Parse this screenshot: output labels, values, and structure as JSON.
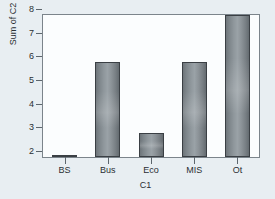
{
  "chart_data": {
    "type": "bar",
    "title": "",
    "categories": [
      "BS",
      "Bus",
      "Eco",
      "MIS",
      "Ot"
    ],
    "values": [
      2,
      6,
      3,
      6,
      8
    ],
    "xlabel": "C1",
    "ylabel": "Sum of C2",
    "ylim": [
      2,
      8
    ],
    "yticks": [
      8,
      7,
      6,
      5,
      4,
      3,
      2
    ],
    "ytick_labels": [
      "8",
      "7",
      "6",
      "5",
      "4",
      "3",
      "2"
    ],
    "grid": false,
    "legend": null,
    "orientation": "vertical"
  },
  "style": {
    "page_background": "#e8eef2",
    "plot_background": "#fbfdfe",
    "axis_color": "#7b848b",
    "bar_fill": "#8f979c",
    "bar_edge": "#3a3f44",
    "text_color": "#2a2f33"
  }
}
